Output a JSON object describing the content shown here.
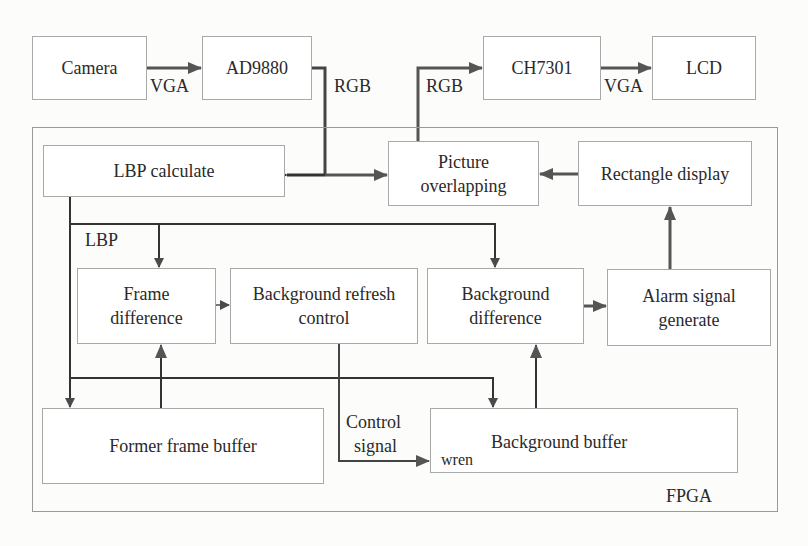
{
  "diagram": {
    "container": {
      "id": "fpga",
      "label": "FPGA"
    },
    "nodes": [
      {
        "id": "camera",
        "label": "Camera",
        "outside_fpga": true
      },
      {
        "id": "ad9880",
        "label": "AD9880",
        "outside_fpga": true
      },
      {
        "id": "ch7301",
        "label": "CH7301",
        "outside_fpga": true
      },
      {
        "id": "lcd",
        "label": "LCD",
        "outside_fpga": true
      },
      {
        "id": "lbp_calculate",
        "label": "LBP calculate"
      },
      {
        "id": "picture_overlapping",
        "label_line1": "Picture",
        "label_line2": "overlapping"
      },
      {
        "id": "rectangle_display",
        "label": "Rectangle display"
      },
      {
        "id": "frame_difference",
        "label_line1": "Frame",
        "label_line2": "difference"
      },
      {
        "id": "background_refresh_control",
        "label_line1": "Background refresh",
        "label_line2": "control"
      },
      {
        "id": "background_difference",
        "label_line1": "Background",
        "label_line2": "difference"
      },
      {
        "id": "alarm_signal_generate",
        "label_line1": "Alarm signal",
        "label_line2": "generate"
      },
      {
        "id": "former_frame_buffer",
        "label": "Former frame buffer"
      },
      {
        "id": "background_buffer",
        "label": "Background buffer",
        "port": "wren"
      }
    ],
    "edges": [
      {
        "from": "camera",
        "to": "ad9880",
        "label": "VGA"
      },
      {
        "from": "ad9880",
        "to": [
          "lbp_calculate",
          "picture_overlapping"
        ],
        "label": "RGB"
      },
      {
        "from": "picture_overlapping",
        "to": "ch7301",
        "label": "RGB"
      },
      {
        "from": "ch7301",
        "to": "lcd",
        "label": "VGA"
      },
      {
        "from": "rectangle_display",
        "to": "picture_overlapping"
      },
      {
        "from": "alarm_signal_generate",
        "to": "rectangle_display"
      },
      {
        "from": "lbp_calculate",
        "to": [
          "frame_difference",
          "background_difference",
          "former_frame_buffer"
        ],
        "label": "LBP"
      },
      {
        "from": "frame_difference",
        "to": "background_refresh_control"
      },
      {
        "from": "background_difference",
        "to": "alarm_signal_generate"
      },
      {
        "from": "former_frame_buffer",
        "to": "frame_difference"
      },
      {
        "from": "background_buffer",
        "to": "background_difference"
      },
      {
        "from": "lbp_calculate",
        "to": "background_buffer"
      },
      {
        "from": "background_refresh_control",
        "to": "background_buffer",
        "label_line1": "Control",
        "label_line2": "signal",
        "port": "wren"
      }
    ],
    "edge_labels": {
      "vga_1": "VGA",
      "rgb_1": "RGB",
      "rgb_2": "RGB",
      "vga_2": "VGA",
      "lbp": "LBP",
      "control_line1": "Control",
      "control_line2": "signal",
      "wren": "wren"
    },
    "colors": {
      "line": "#333333",
      "arrow_gray": "#555555",
      "box_border": "#a9a9a9",
      "text": "#2a2a2a"
    }
  }
}
